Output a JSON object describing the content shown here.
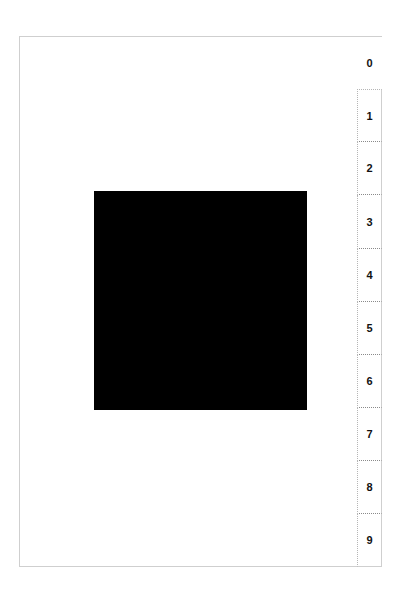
{
  "tabs": [
    {
      "label": "0",
      "selected": true
    },
    {
      "label": "1",
      "selected": false
    },
    {
      "label": "2",
      "selected": false
    },
    {
      "label": "3",
      "selected": false
    },
    {
      "label": "4",
      "selected": false
    },
    {
      "label": "5",
      "selected": false
    },
    {
      "label": "6",
      "selected": false
    },
    {
      "label": "7",
      "selected": false
    },
    {
      "label": "8",
      "selected": false
    },
    {
      "label": "9",
      "selected": false
    }
  ],
  "content": {
    "shape": "black-square",
    "color": "#000000"
  }
}
